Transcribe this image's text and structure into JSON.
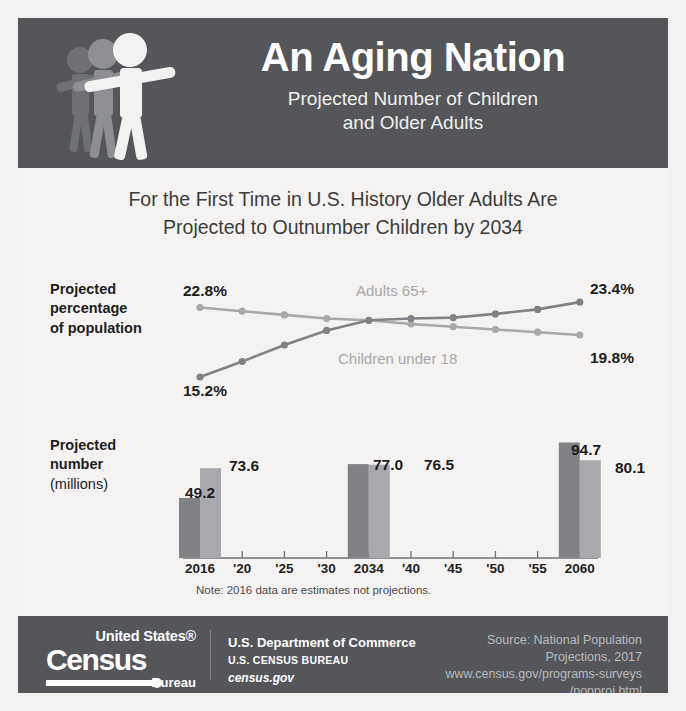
{
  "header": {
    "title": "An Aging Nation",
    "subtitle_line1": "Projected Number of Children",
    "subtitle_line2": "and Older Adults",
    "icon": "three-walking-figures-icon",
    "bg_color": "#54565a"
  },
  "headline": {
    "line1": "For the First Time in U.S. History Older Adults Are",
    "line2": "Projected to Outnumber Children by 2034"
  },
  "line_chart_label": {
    "line1": "Projected",
    "line2": "percentage",
    "line3": "of population"
  },
  "bar_chart_label": {
    "line1": "Projected",
    "line2": "number",
    "line3": "(millions)"
  },
  "note": "Note: 2016 data are estimates not projections.",
  "colors": {
    "adults_65_plus": "#808285",
    "children_under_18": "#a7a9ac",
    "dark_panel": "#54565a",
    "page_bg": "#f4f3f1",
    "text": "#1d1d1d"
  },
  "endpoint_labels": {
    "adults_start": "22.8%",
    "adults_end": "23.4%",
    "children_start": "15.2%",
    "children_end": "19.8%"
  },
  "series_labels": {
    "adults": "Adults 65+",
    "children": "Children under 18"
  },
  "footer": {
    "logo_united_states": "United States",
    "logo_registered": "®",
    "logo_census": "Census",
    "logo_bureau": "Bureau",
    "dept_line1": "U.S. Department of Commerce",
    "dept_line2": "U.S. CENSUS BUREAU",
    "dept_line3": "census.gov",
    "source_line1": "Source: National Population",
    "source_line2": "Projections, 2017",
    "source_line3": "www.census.gov/programs-surveys",
    "source_line4": "/popproj.html"
  },
  "chart_data": [
    {
      "type": "line",
      "title": "Projected percentage of population",
      "xlabel": "",
      "ylabel": "Percent of population",
      "x": [
        2016,
        2020,
        2025,
        2030,
        2034,
        2040,
        2045,
        2050,
        2055,
        2060
      ],
      "xtick_labels": [
        "2016",
        "'20",
        "'25",
        "'30",
        "2034",
        "'40",
        "'45",
        "'50",
        "'55",
        "2060"
      ],
      "ylim": [
        14.0,
        24.5
      ],
      "grid": false,
      "legend": "inline-labels",
      "series": [
        {
          "name": "Children under 18",
          "color": "#a7a9ac",
          "values": [
            22.8,
            22.4,
            22.0,
            21.6,
            21.4,
            21.0,
            20.7,
            20.4,
            20.1,
            19.8
          ],
          "start_label": "22.8%",
          "end_label": "19.8%"
        },
        {
          "name": "Adults 65+",
          "color": "#808285",
          "values": [
            15.2,
            16.9,
            18.7,
            20.3,
            21.4,
            21.6,
            21.7,
            22.1,
            22.6,
            23.4
          ],
          "start_label": "15.2%",
          "end_label": "23.4%"
        }
      ],
      "annotations": [
        "Crossover occurs at 2034"
      ]
    },
    {
      "type": "bar",
      "title": "Projected number (millions)",
      "xlabel": "",
      "ylabel": "Millions",
      "categories": [
        "2016",
        "'20",
        "'25",
        "'30",
        "2034",
        "'40",
        "'45",
        "'50",
        "'55",
        "2060"
      ],
      "ylim": [
        0,
        100
      ],
      "grid": false,
      "series": [
        {
          "name": "Adults 65+",
          "color": "#808285",
          "labeled_points": [
            {
              "category": "2016",
              "value": 49.2,
              "label": "49.2"
            },
            {
              "category": "2034",
              "value": 77.0,
              "label": "77.0"
            },
            {
              "category": "2060",
              "value": 94.7,
              "label": "94.7"
            }
          ]
        },
        {
          "name": "Children under 18",
          "color": "#a7a9ac",
          "labeled_points": [
            {
              "category": "2016",
              "value": 73.6,
              "label": "73.6"
            },
            {
              "category": "2034",
              "value": 76.5,
              "label": "76.5"
            },
            {
              "category": "2060",
              "value": 80.1,
              "label": "80.1"
            }
          ]
        }
      ],
      "note": "Note: 2016 data are estimates not projections."
    }
  ]
}
